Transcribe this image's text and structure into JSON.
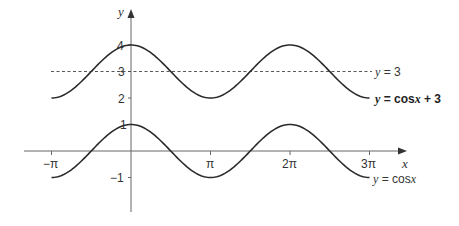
{
  "chart_data": {
    "type": "line",
    "title": "",
    "xlabel": "x",
    "ylabel": "y",
    "x_ticks": [
      "−π",
      "π",
      "2π",
      "3π"
    ],
    "x_tick_values": [
      -3.14159,
      3.14159,
      6.28319,
      9.42478
    ],
    "y_ticks": [
      "−1",
      "1",
      "2",
      "3",
      "4"
    ],
    "y_tick_values": [
      -1,
      1,
      2,
      3,
      4
    ],
    "xlim": [
      -3.14159,
      9.42478
    ],
    "ylim": [
      -1,
      4
    ],
    "grid": false,
    "series": [
      {
        "name": "y = cos x + 3",
        "function": "cos(x) + 3",
        "style": "solid",
        "label_bold": true,
        "x": [
          -3.14159,
          0,
          3.14159,
          6.28319,
          9.42478
        ],
        "values": [
          2,
          4,
          2,
          4,
          2
        ]
      },
      {
        "name": "y = 3",
        "function": "3",
        "style": "dashed",
        "x": [
          -3.14159,
          9.42478
        ],
        "values": [
          3,
          3
        ]
      },
      {
        "name": "y = cos x",
        "function": "cos(x)",
        "style": "solid",
        "x": [
          -3.14159,
          0,
          3.14159,
          6.28319,
          9.42478
        ],
        "values": [
          -1,
          1,
          -1,
          1,
          -1
        ]
      }
    ]
  },
  "labels": {
    "y_axis": "y",
    "x_axis": "x",
    "tick_neg_pi": "−π",
    "tick_pi": "π",
    "tick_2pi": "2π",
    "tick_3pi": "3π",
    "tick_4": "4",
    "tick_3": "3",
    "tick_2": "2",
    "tick_1": "1",
    "tick_neg1": "−1",
    "legend_y3": "y = 3",
    "legend_cos3": "y = cos x + 3",
    "legend_cos": "y = cos x"
  },
  "colors": {
    "curve": "#2a2a2a",
    "axis": "#555555",
    "dashed": "#444444"
  }
}
